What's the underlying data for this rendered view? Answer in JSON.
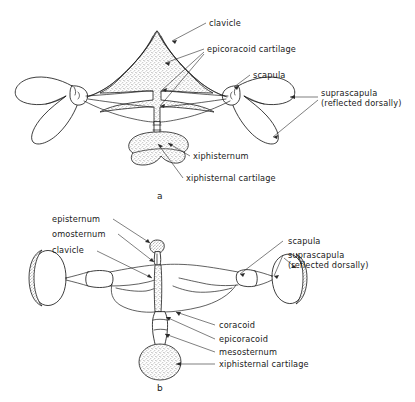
{
  "figure": {
    "background_color": "#ffffff",
    "ink_color": "#1c1c1c",
    "panels": [
      {
        "id": "a",
        "caption": "a",
        "description": "arciferal pectoral girdle, ventral view",
        "labels": [
          {
            "key": "clavicle",
            "text": "clavicle"
          },
          {
            "key": "epicoracoid_cartilage",
            "text": "epicoracoid cartilage"
          },
          {
            "key": "scapula",
            "text": "scapula"
          },
          {
            "key": "suprascapula_line1",
            "text": "suprascapula"
          },
          {
            "key": "suprascapula_line2",
            "text": "(reflected dorsally)"
          },
          {
            "key": "xiphisternum",
            "text": "xiphisternum"
          },
          {
            "key": "xiphisternal_cartilage",
            "text": "xiphisternal cartilage"
          }
        ]
      },
      {
        "id": "b",
        "caption": "b",
        "description": "firmisternal pectoral girdle, ventral view",
        "labels": [
          {
            "key": "episternum",
            "text": "episternum"
          },
          {
            "key": "omosternum",
            "text": "omosternum"
          },
          {
            "key": "clavicle",
            "text": "clavicle"
          },
          {
            "key": "scapula",
            "text": "scapula"
          },
          {
            "key": "suprascapula_line1",
            "text": "suprascapula"
          },
          {
            "key": "suprascapula_line2",
            "text": "(reflected dorsally)"
          },
          {
            "key": "coracoid",
            "text": "coracoid"
          },
          {
            "key": "epicoracoid",
            "text": "epicoracoid"
          },
          {
            "key": "mesosternum",
            "text": "mesosternum"
          },
          {
            "key": "xiphisternal_cartilage",
            "text": "xiphisternal cartilage"
          }
        ]
      }
    ]
  }
}
